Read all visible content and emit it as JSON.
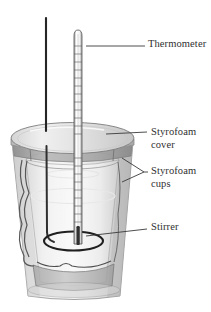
{
  "figure": {
    "background_color": "#ffffff",
    "ink_color": "#2f2f2f"
  },
  "labels": {
    "thermometer": "Thermometer",
    "cover_line1": "Styrofoam",
    "cover_line2": "cover",
    "cups_line1": "Styrofoam",
    "cups_line2": "cups",
    "stirrer": "Stirrer"
  },
  "parts": [
    {
      "name": "thermometer",
      "label": "Thermometer",
      "description": "graduated glass thermometer through the cover"
    },
    {
      "name": "styrofoam-cover",
      "label": "Styrofoam cover",
      "description": "lid disc on top of the cups"
    },
    {
      "name": "styrofoam-cups",
      "label": "Styrofoam cups",
      "description": "two nested insulating cups"
    },
    {
      "name": "stirrer",
      "label": "Stirrer",
      "description": "rod with a loop at the bottom"
    }
  ],
  "colors": {
    "outline": "#4a4a4a",
    "cup_light": "#efefef",
    "cup_mid": "#d8d8d8",
    "cup_shadow": "#b8b8b8",
    "lid_top": "#e6e6e6",
    "lid_edge": "#a9a9a9",
    "stirrer": "#2a2a2a",
    "leader": "#3a3a3a"
  }
}
